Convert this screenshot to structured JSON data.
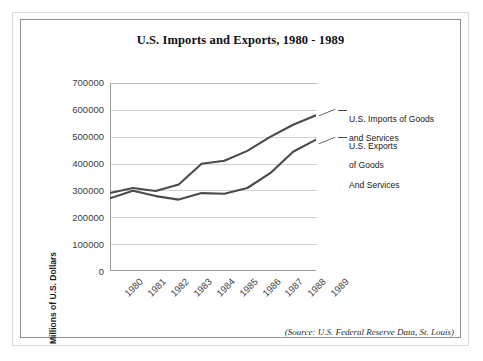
{
  "page": {
    "cropped_top_text": "",
    "source_note": "(Source: U.S. Federal Reserve Data, St. Louis)"
  },
  "chart_data": {
    "type": "line",
    "title": "U.S. Imports and Exports, 1980 - 1989",
    "xlabel": "",
    "ylabel": "Millions of U.S. Dollars",
    "categories": [
      "1980",
      "1981",
      "1982",
      "1983",
      "1984",
      "1985",
      "1986",
      "1987",
      "1988",
      "1989"
    ],
    "ylim": [
      0,
      700000
    ],
    "ytick_labels": [
      "700000",
      "600000",
      "500000",
      "400000",
      "300000",
      "200000",
      "100000",
      "0"
    ],
    "ytick_values": [
      700000,
      600000,
      500000,
      400000,
      300000,
      200000,
      100000,
      0
    ],
    "grid": true,
    "legend_position": "right-of-plot-direct-labels",
    "series": [
      {
        "name": "U.S. Imports of Goods and Services",
        "label_line1": "U.S. Imports of Goods",
        "label_line2": "and Services",
        "color": "#4a4a4a",
        "values": [
          291000,
          310000,
          299000,
          323000,
          400000,
          411000,
          448000,
          500000,
          545000,
          580000
        ]
      },
      {
        "name": "U.S. Exports of Goods And Services",
        "label_line1": "U.S. Exports",
        "label_line2": "of Goods",
        "label_line3": "And Services",
        "color": "#4a4a4a",
        "values": [
          272000,
          300000,
          280000,
          267000,
          291000,
          289000,
          310000,
          365000,
          445000,
          490000
        ]
      }
    ]
  }
}
